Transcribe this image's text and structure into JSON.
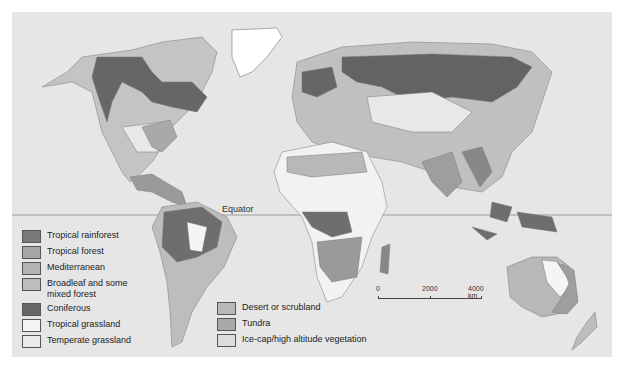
{
  "map": {
    "equator_label": "Equator",
    "background_color": "#e6e6e6",
    "ocean_color": "#e6e6e6"
  },
  "legend": {
    "items": [
      {
        "label": "Tropical rainforest",
        "color": "#7a7a7a"
      },
      {
        "label": "Tropical forest",
        "color": "#a6a6a6"
      },
      {
        "label": "Mediterranean",
        "color": "#b3b3b3"
      },
      {
        "label": "Broadleaf and some mixed forest",
        "line1": "Broadleaf and some",
        "line2": "mixed forest",
        "color": "#bdbdbd"
      },
      {
        "label": "Coniferous",
        "color": "#666666"
      },
      {
        "label": "Tropical grassland",
        "color": "#f5f5f5"
      },
      {
        "label": "Temperate grassland",
        "color": "#ebebeb"
      },
      {
        "label": "Desert or scrubland",
        "color": "#b8b8b8"
      },
      {
        "label": "Tundra",
        "color": "#a9a9a9"
      },
      {
        "label": "Ice-cap/high altitude vegetation",
        "color": "#dcdcdc"
      }
    ]
  },
  "scale_bar": {
    "ticks": [
      "0",
      "2000",
      "4000 km"
    ]
  }
}
